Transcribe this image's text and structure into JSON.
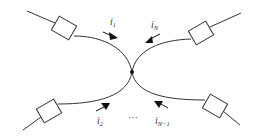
{
  "diagram": {
    "colors": {
      "line": "#333333",
      "arrow": "#111111",
      "background": "#ffffff"
    },
    "node": {
      "label": ""
    },
    "branches": [
      {
        "id": "top-left",
        "current": {
          "symbol": "i",
          "subscript": "1"
        },
        "arrow_direction": "toward-node"
      },
      {
        "id": "top-right",
        "current": {
          "symbol": "i",
          "subscript": "N"
        },
        "arrow_direction": "toward-node"
      },
      {
        "id": "bottom-left",
        "current": {
          "symbol": "i",
          "subscript": "2"
        },
        "arrow_direction": "toward-node"
      },
      {
        "id": "bottom-right",
        "current": {
          "symbol": "i",
          "subscript": "N−1"
        },
        "arrow_direction": "toward-node"
      }
    ],
    "ellipsis": "···"
  }
}
